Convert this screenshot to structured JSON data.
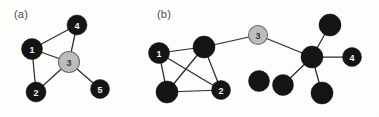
{
  "figure": {
    "width": 379,
    "height": 117,
    "background_color": "#fdfdfc"
  },
  "style": {
    "node_dark_color": "#141414",
    "node_gray_color": "#bdbdbd",
    "node_gray_border": "#6e6e6e",
    "edge_color": "#2b2b2b",
    "dark_label_color": "#f2f2f2",
    "gray_label_color": "#3a3a3a",
    "panel_label_color": "#4a4a4a"
  },
  "panels": [
    {
      "id": "panel-a",
      "label": "(a)",
      "label_x": 14,
      "label_y": 8,
      "nodes": [
        {
          "id": "a1",
          "label": "1",
          "x": 32,
          "y": 49,
          "r": 10.5,
          "fill": "dark"
        },
        {
          "id": "a2",
          "label": "2",
          "x": 36,
          "y": 92,
          "r": 10.0,
          "fill": "dark"
        },
        {
          "id": "a3",
          "label": "3",
          "x": 69,
          "y": 62,
          "r": 10.5,
          "fill": "gray"
        },
        {
          "id": "a4",
          "label": "4",
          "x": 77,
          "y": 25,
          "r": 10.0,
          "fill": "dark"
        },
        {
          "id": "a5",
          "label": "5",
          "x": 100,
          "y": 89,
          "r": 9.5,
          "fill": "dark"
        }
      ],
      "edges": [
        {
          "from": "a1",
          "to": "a4"
        },
        {
          "from": "a1",
          "to": "a3"
        },
        {
          "from": "a1",
          "to": "a2"
        },
        {
          "from": "a4",
          "to": "a3"
        },
        {
          "from": "a3",
          "to": "a2"
        },
        {
          "from": "a3",
          "to": "a5"
        }
      ]
    },
    {
      "id": "panel-b",
      "label": "(b)",
      "label_x": 157,
      "label_y": 8,
      "nodes": [
        {
          "id": "b1",
          "label": "1",
          "x": 159,
          "y": 53,
          "r": 10.5,
          "fill": "dark"
        },
        {
          "id": "bh",
          "label": "",
          "x": 204,
          "y": 47,
          "r": 11.0,
          "fill": "dark"
        },
        {
          "id": "bbl",
          "label": "",
          "x": 167,
          "y": 92,
          "r": 11.0,
          "fill": "dark"
        },
        {
          "id": "b2",
          "label": "2",
          "x": 221,
          "y": 90,
          "r": 9.5,
          "fill": "dark"
        },
        {
          "id": "b3",
          "label": "3",
          "x": 258,
          "y": 35,
          "r": 9.5,
          "fill": "gray"
        },
        {
          "id": "bsc",
          "label": "",
          "x": 312,
          "y": 57,
          "r": 11.0,
          "fill": "dark"
        },
        {
          "id": "bt",
          "label": "",
          "x": 330,
          "y": 25,
          "r": 11.0,
          "fill": "dark"
        },
        {
          "id": "b4",
          "label": "4",
          "x": 352,
          "y": 57,
          "r": 9.5,
          "fill": "dark"
        },
        {
          "id": "bl1",
          "label": "",
          "x": 283,
          "y": 85,
          "r": 10.5,
          "fill": "dark"
        },
        {
          "id": "bl2",
          "label": "",
          "x": 322,
          "y": 93,
          "r": 11.0,
          "fill": "dark"
        },
        {
          "id": "biso",
          "label": "",
          "x": 259,
          "y": 81,
          "r": 10.5,
          "fill": "dark"
        }
      ],
      "edges": [
        {
          "from": "b1",
          "to": "bh"
        },
        {
          "from": "b1",
          "to": "bbl"
        },
        {
          "from": "b1",
          "to": "b2"
        },
        {
          "from": "bh",
          "to": "bbl"
        },
        {
          "from": "bh",
          "to": "b2"
        },
        {
          "from": "bbl",
          "to": "b2"
        },
        {
          "from": "bh",
          "to": "b3"
        },
        {
          "from": "b3",
          "to": "bsc"
        },
        {
          "from": "bsc",
          "to": "bt"
        },
        {
          "from": "bsc",
          "to": "b4"
        },
        {
          "from": "bsc",
          "to": "bl1"
        },
        {
          "from": "bsc",
          "to": "bl2"
        }
      ]
    }
  ]
}
